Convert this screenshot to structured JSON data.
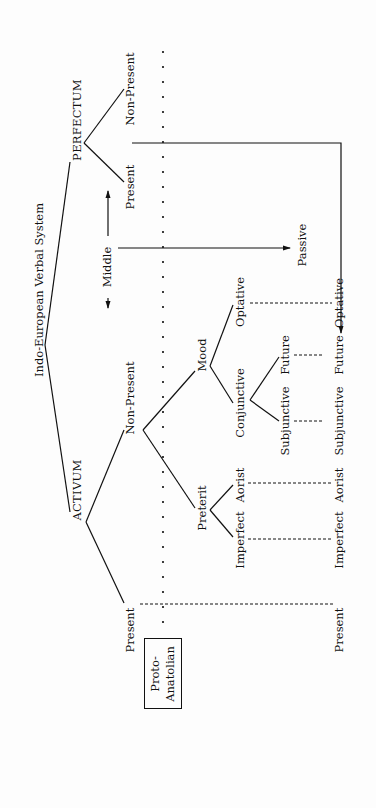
{
  "title": "Indo-European Verbal System",
  "branches": {
    "perfectum": {
      "label": "PERFECTUM",
      "children": [
        "Non-Present",
        "Present"
      ]
    },
    "activum": {
      "label": "ACTIVUM",
      "present": "Present",
      "non_present": {
        "label": "Non-Present",
        "mood": {
          "label": "Mood",
          "optative": "Optative",
          "conjunctive": {
            "label": "Conjunctive",
            "future": "Future",
            "subjunctive": "Subjunctive"
          }
        },
        "preterit": {
          "label": "Preterit",
          "aorist": "Aorist",
          "imperfect": "Imperfect"
        }
      }
    }
  },
  "voice": {
    "middle": "Middle",
    "passive": "Passive"
  },
  "outcomes": [
    "Optative",
    "Future",
    "Subjunctive",
    "Aorist",
    "Imperfect",
    "Present"
  ],
  "proto_anatolian": {
    "line1": "Proto-",
    "line2": "Anatolian"
  }
}
